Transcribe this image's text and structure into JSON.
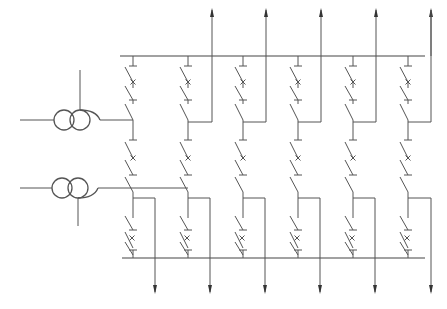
{
  "diagram": {
    "title": "",
    "kind": "single-line electrical diagram (breaker-and-a-half scheme)",
    "line_color": "#555555",
    "background": "#ffffff",
    "buses": [
      {
        "id": "bus-top",
        "label": ""
      },
      {
        "id": "bus-bottom",
        "label": ""
      }
    ],
    "transformers": [
      {
        "id": "transformer-1",
        "symbol": "two-winding-transformer",
        "connects_to_bay": 1,
        "tap": "top"
      },
      {
        "id": "transformer-2",
        "symbol": "two-winding-transformer",
        "connects_to_bay": 2,
        "tap": "bottom"
      }
    ],
    "bays": [
      {
        "id": 1,
        "upper_feeder": "transformer-1",
        "lower_feeder": "transformer-2-via-bay-line",
        "breakers": 3
      },
      {
        "id": 2,
        "upper_feeder": "outgoing-up",
        "lower_feeder": "outgoing-down",
        "breakers": 3
      },
      {
        "id": 3,
        "upper_feeder": "outgoing-up",
        "lower_feeder": "outgoing-down",
        "breakers": 3
      },
      {
        "id": 4,
        "upper_feeder": "outgoing-up",
        "lower_feeder": "outgoing-down",
        "breakers": 3
      },
      {
        "id": 5,
        "upper_feeder": "outgoing-up",
        "lower_feeder": "outgoing-down",
        "breakers": 3
      },
      {
        "id": 6,
        "upper_feeder": "outgoing-up",
        "lower_feeder": "outgoing-down",
        "breakers": 3
      }
    ],
    "outgoing_up_count": 6,
    "outgoing_down_count": 6,
    "symbols": {
      "switch": "disconnector-icon",
      "breaker": "circuit-breaker-icon",
      "arrow": "feeder-arrow-icon"
    }
  }
}
